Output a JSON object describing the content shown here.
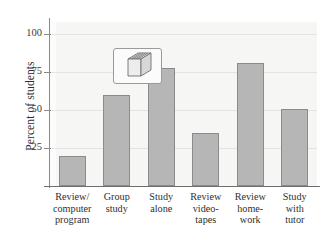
{
  "chart_data": {
    "type": "bar",
    "title": "",
    "xlabel": "",
    "ylabel": "Percent of students",
    "categories": [
      "Review/ computer program",
      "Group study",
      "Study alone",
      "Review video- tapes",
      "Review home- work",
      "Study with tutor"
    ],
    "category_lines": [
      [
        "Review/",
        "computer",
        "program"
      ],
      [
        "Group",
        "study"
      ],
      [
        "Study",
        "alone"
      ],
      [
        "Review",
        "video-",
        "tapes"
      ],
      [
        "Review",
        "home-",
        "work"
      ],
      [
        "Study",
        "with",
        "tutor"
      ]
    ],
    "values": [
      20,
      60,
      78,
      35,
      81,
      51
    ],
    "ylim": [
      0,
      108
    ],
    "yticks": [
      25,
      50,
      75,
      100
    ],
    "ytick_labels": [
      "25",
      "50",
      "75",
      "100"
    ],
    "grid": true,
    "legend": "none"
  },
  "colors": {
    "bar_fill": "#b6b6b6",
    "bar_edge": "#8b8b8b",
    "plot_background": "#f6f6f5",
    "gridline": "#e3e3e1",
    "axis": "#8a8a8a",
    "text": "#2f2f2f"
  },
  "icon": {
    "name": "stack-of-books-icon",
    "description": "three-dimensional stack of books"
  }
}
